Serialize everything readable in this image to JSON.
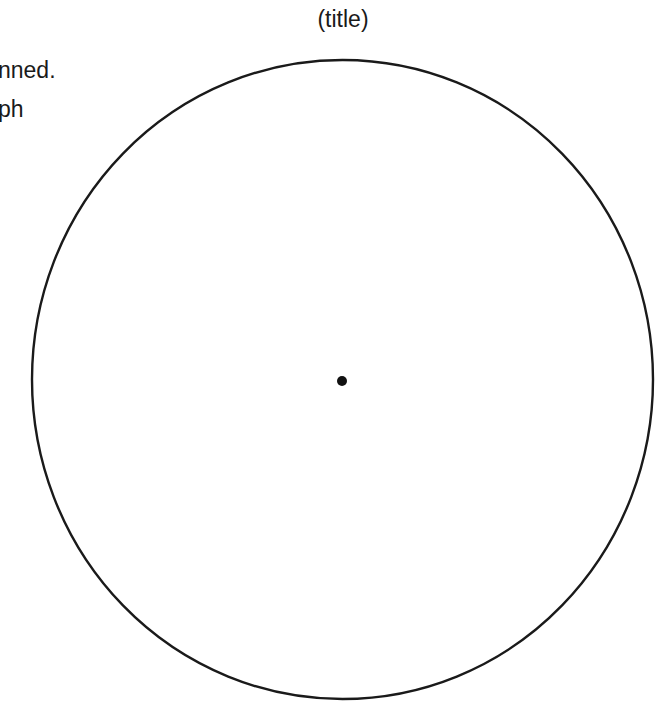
{
  "diagram": {
    "title": "(title)",
    "side_text_fragments": [
      "nned.",
      "ph"
    ],
    "shapes": [
      {
        "type": "circle",
        "name": "main-circle",
        "cx": 342.5,
        "cy": 379.5,
        "rx": 310.5,
        "ry": 319.5,
        "stroke": "#1a1a1a",
        "fill": "none"
      },
      {
        "type": "dot",
        "name": "center-point",
        "cx": 342,
        "cy": 381,
        "r": 5,
        "fill": "#111111"
      }
    ]
  }
}
